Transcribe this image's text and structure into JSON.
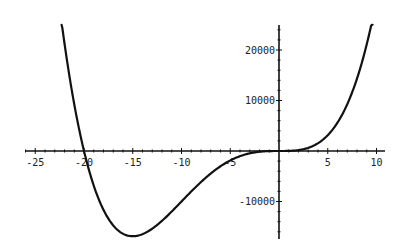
{
  "chart_data": {
    "type": "line",
    "title": "",
    "xlabel": "",
    "ylabel": "",
    "function": "x^4 + 20x^3",
    "xlim": [
      -25,
      10
    ],
    "ylim": [
      -17000,
      25000
    ],
    "x_ticks": [
      -25,
      -20,
      -15,
      -10,
      -5,
      5,
      10
    ],
    "x_tick_labels": [
      "-25",
      "-20",
      "-15",
      "-10",
      "-5",
      "5",
      "10"
    ],
    "y_ticks": [
      -10000,
      10000,
      20000
    ],
    "y_tick_labels": [
      "-10000",
      "10000",
      "20000"
    ],
    "grid": false,
    "legend": null,
    "series": [
      {
        "name": "f(x)",
        "x": [
          -22.3,
          -21,
          -20,
          -19,
          -18,
          -17,
          -16,
          -15,
          -14,
          -13,
          -12,
          -11,
          -10,
          -9,
          -8,
          -7,
          -6,
          -5,
          -4,
          -3,
          -2,
          -1,
          0,
          1,
          2,
          3,
          4,
          5,
          6,
          7,
          8,
          9,
          9.6
        ],
        "values": [
          25000,
          9261,
          0,
          -6859,
          -11664,
          -14739,
          -16384,
          -16875,
          -16464,
          -15379,
          -13824,
          -11979,
          -10000,
          -8019,
          -6144,
          -4459,
          -3024,
          -1875,
          -1024,
          -459,
          -144,
          -19,
          0,
          21,
          176,
          621,
          1536,
          3125,
          5616,
          9261,
          14336,
          21141,
          25847
        ]
      }
    ]
  }
}
